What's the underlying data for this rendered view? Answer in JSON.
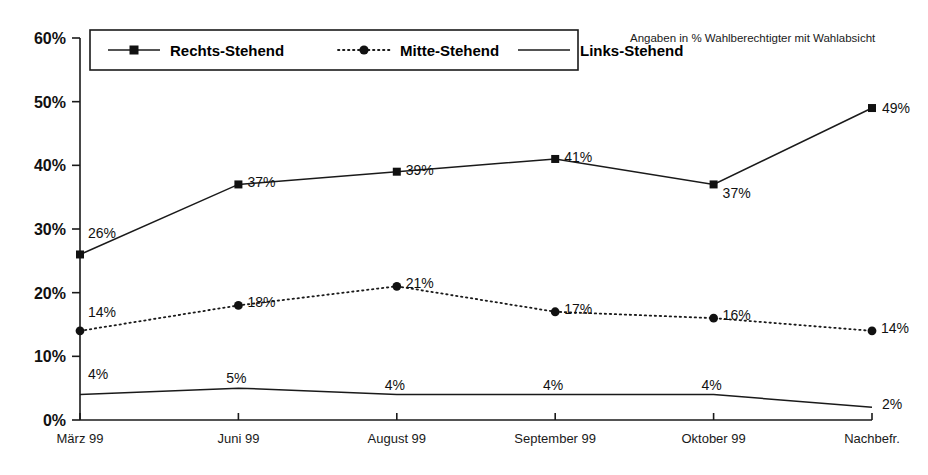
{
  "chart_data": {
    "type": "line",
    "title": "",
    "subtitle": "Angaben in % Wahlberechtigter mit Wahlabsicht",
    "xlabel": "",
    "ylabel": "",
    "ylim": [
      0,
      60
    ],
    "ytick_values": [
      0,
      10,
      20,
      30,
      40,
      50,
      60
    ],
    "ytick_labels": [
      "0%",
      "10%",
      "20%",
      "30%",
      "40%",
      "50%",
      "60%"
    ],
    "grid": false,
    "legend_position": "top-left-inside",
    "categories": [
      "März 99",
      "Juni 99",
      "August 99",
      "September 99",
      "Oktober 99",
      "Nachbefr."
    ],
    "series": [
      {
        "name": "Rechts-Stehend",
        "style": "solid",
        "marker": "square",
        "values": [
          26,
          37,
          39,
          41,
          37,
          49
        ],
        "labels": [
          "26%",
          "37%",
          "39%",
          "41%",
          "37%",
          "49%"
        ]
      },
      {
        "name": "Mitte-Stehend",
        "style": "dotted",
        "marker": "dot",
        "values": [
          14,
          18,
          21,
          17,
          16,
          14
        ],
        "labels": [
          "14%",
          "18%",
          "21%",
          "17%",
          "16%",
          "14%"
        ]
      },
      {
        "name": "Links-Stehend",
        "style": "solid",
        "marker": "none",
        "values": [
          4,
          5,
          4,
          4,
          4,
          2
        ],
        "labels": [
          "4%",
          "5%",
          "4%",
          "4%",
          "4%",
          "2%"
        ]
      }
    ],
    "colors": {
      "line": "#1a1a1a",
      "text": "#111111",
      "background": "#ffffff"
    }
  }
}
